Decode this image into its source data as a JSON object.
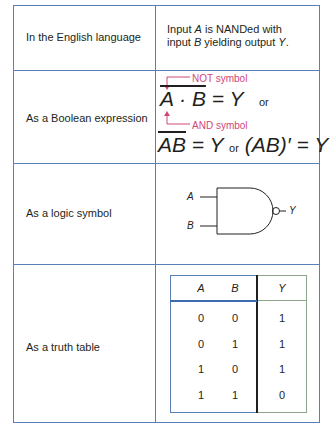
{
  "rows": [
    {
      "label": "In the English language"
    },
    {
      "label": "As a Boolean expression"
    },
    {
      "label": "As a logic symbol"
    },
    {
      "label": "As a truth table"
    }
  ],
  "english": {
    "line1_pre": "Input ",
    "line1_var": "A",
    "line1_post": " is NANDed with",
    "line2_pre": "input ",
    "line2_var": "B",
    "line2_mid": " yielding output ",
    "line2_var2": "Y",
    "line2_post": "."
  },
  "boolean": {
    "not_annotation": "NOT symbol",
    "and_annotation": "AND symbol",
    "expr1_lhs": "A · B",
    "expr1_rhs": " = Y",
    "or1": "or",
    "expr2_lhs": "AB",
    "expr2_rhs": " = Y",
    "or2": "or",
    "expr3": "(AB)′ = Y",
    "annotation_color": "#d0467a"
  },
  "logic_symbol": {
    "input_a": "A",
    "input_b": "B",
    "output": "Y"
  },
  "truth_table": {
    "headers": [
      "A",
      "B",
      "Y"
    ],
    "rows": [
      [
        "0",
        "0",
        "1"
      ],
      [
        "0",
        "1",
        "1"
      ],
      [
        "1",
        "0",
        "1"
      ],
      [
        "1",
        "1",
        "0"
      ]
    ]
  },
  "colors": {
    "border": "#5b7fb8",
    "output_border": "#8aa58a",
    "annotation": "#d0467a"
  }
}
